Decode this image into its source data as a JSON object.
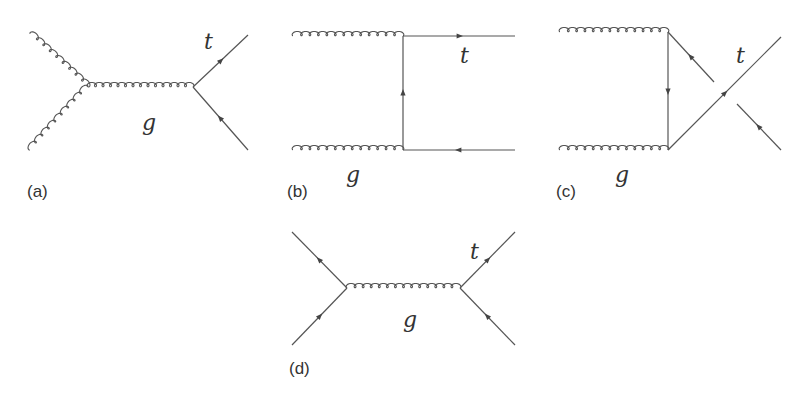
{
  "figure": {
    "diagrams": [
      {
        "id": "a",
        "label": "(a)",
        "particle_labels": {
          "quark": "t",
          "gluon": "g"
        }
      },
      {
        "id": "b",
        "label": "(b)",
        "particle_labels": {
          "quark": "t",
          "gluon": "g"
        }
      },
      {
        "id": "c",
        "label": "(c)",
        "particle_labels": {
          "quark": "t",
          "gluon": "g"
        }
      },
      {
        "id": "d",
        "label": "(d)",
        "particle_labels": {
          "quark": "t",
          "gluon": "g"
        }
      }
    ]
  },
  "colors": {
    "line": "#555555",
    "text": "#333333",
    "background": "#ffffff"
  }
}
